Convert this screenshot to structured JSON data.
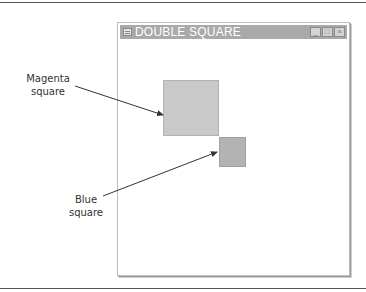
{
  "window": {
    "title": "DOUBLE SQUARE",
    "buttons": {
      "minimize": "_",
      "maximize": "□",
      "close": "×"
    }
  },
  "annotations": [
    {
      "id": "magenta",
      "line1": "Magenta",
      "line2": "square",
      "target": "large square (top-left)"
    },
    {
      "id": "blue",
      "line1": "Blue",
      "line2": "square",
      "target": "small square (bottom-right)"
    }
  ],
  "colors": {
    "large_square": "#c9c9c9",
    "small_square": "#b3b3b3",
    "titlebar": "#a9a9a9"
  }
}
